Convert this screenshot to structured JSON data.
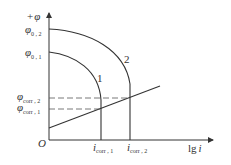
{
  "diagram": {
    "y_axis": {
      "label_sign": "+",
      "label_symbol": "φ"
    },
    "x_axis": {
      "label_lg": "lg",
      "label_var": "i"
    },
    "origin": "O",
    "y_ticks": [
      {
        "symbol": "φ",
        "subscript": "0 , 2"
      },
      {
        "symbol": "φ",
        "subscript": "0 , 1"
      },
      {
        "symbol": "φ",
        "subscript": "corr , 2"
      },
      {
        "symbol": "φ",
        "subscript": "corr , 1"
      }
    ],
    "x_ticks": [
      {
        "symbol": "i",
        "subscript": "corr , 1"
      },
      {
        "symbol": "i",
        "subscript": "corr , 2"
      }
    ],
    "curves": [
      {
        "label": "1"
      },
      {
        "label": "2"
      }
    ],
    "colors": {
      "line": "#333333",
      "background": "#ffffff"
    }
  }
}
